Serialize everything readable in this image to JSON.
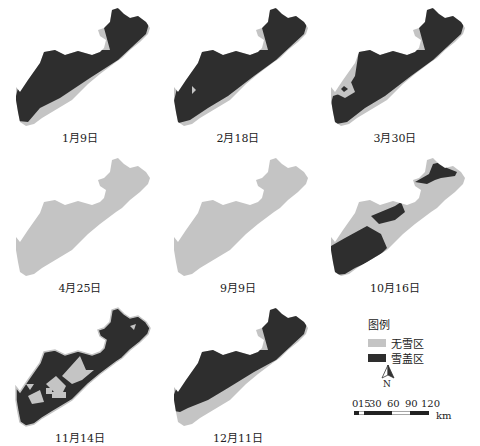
{
  "colors": {
    "snow_free": "#c4c4c4",
    "snow_cover": "#2e2e2e",
    "outline": "#9a9a9a",
    "background": "#ffffff"
  },
  "panels": [
    {
      "date": "1月9日",
      "state": "mostly snow covered, light strip along south-east edge"
    },
    {
      "date": "2月18日",
      "state": "mostly snow covered, small gap in west"
    },
    {
      "date": "3月30日",
      "state": "mostly snow covered, small snow-free patch in west"
    },
    {
      "date": "4月25日",
      "state": "entirely snow free"
    },
    {
      "date": "9月9日",
      "state": "entirely snow free"
    },
    {
      "date": "10月16日",
      "state": "partial snow cover: south-west block, central block, north-east block"
    },
    {
      "date": "11月14日",
      "state": "mostly snow covered with triangular snow-free patches"
    },
    {
      "date": "12月11日",
      "state": "mostly snow covered, snow-free strip along south edge"
    }
  ],
  "legend": {
    "title": "图例",
    "items": [
      {
        "label": "无雪区",
        "color": "#c4c4c4"
      },
      {
        "label": "雪盖区",
        "color": "#2e2e2e"
      }
    ]
  },
  "north_arrow": {
    "label": "N"
  },
  "scale_bar": {
    "ticks": [
      "0",
      "15",
      "30",
      "60",
      "90",
      "120"
    ],
    "unit": "km"
  }
}
